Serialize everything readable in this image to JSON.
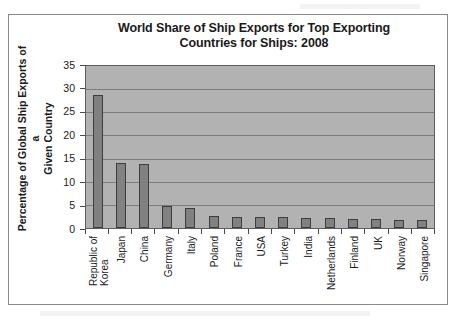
{
  "chart_data": {
    "type": "bar",
    "title": "World Share of Ship Exports for Top Exporting Countries for Ships: 2008",
    "title_line1": "World Share of Ship Exports for Top Exporting",
    "title_line2": "Countries for Ships: 2008",
    "xlabel": "",
    "ylabel": "Percentage of Global Ship Exports of a Given Country",
    "ylabel_line1": "Percentage of Global Ship Exports of a",
    "ylabel_line2": "Given Country",
    "ylim": [
      0,
      35
    ],
    "ytick_labels": [
      "35",
      "30",
      "25",
      "20",
      "15",
      "10",
      "5",
      "0"
    ],
    "ytick_values": [
      35,
      30,
      25,
      20,
      15,
      10,
      5,
      0
    ],
    "grid": true,
    "legend": "none",
    "categories": [
      "Republic of Korea",
      "Japan",
      "China",
      "Germany",
      "Italy",
      "Poland",
      "France",
      "USA",
      "Turkey",
      "India",
      "Netherlands",
      "Finland",
      "UK",
      "Norway",
      "Singapore"
    ],
    "category_lines": [
      [
        "Republic of",
        "Korea"
      ],
      [
        "Japan"
      ],
      [
        "China"
      ],
      [
        "Germany"
      ],
      [
        "Italy"
      ],
      [
        "Poland"
      ],
      [
        "France"
      ],
      [
        "USA"
      ],
      [
        "Turkey"
      ],
      [
        "India"
      ],
      [
        "Netherlands"
      ],
      [
        "Finland"
      ],
      [
        "UK"
      ],
      [
        "Norway"
      ],
      [
        "Singapore"
      ]
    ],
    "values": [
      28.8,
      14.0,
      13.9,
      4.7,
      4.3,
      2.5,
      2.4,
      2.4,
      2.3,
      2.2,
      2.1,
      2.0,
      1.9,
      1.8,
      1.7
    ],
    "colors": {
      "bar_fill": "#818181",
      "bar_border": "#3d3d3d",
      "plot_background": "#b2b2b2",
      "gridline": "#7c7c7c",
      "axis": "#4a4a4a",
      "text": "#1a1a1a",
      "frame": "#8a8a8a",
      "page_background": "#ffffff"
    }
  }
}
